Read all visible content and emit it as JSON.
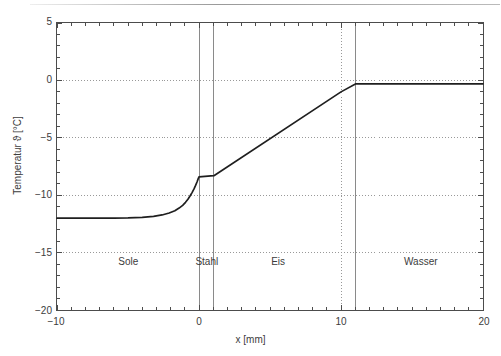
{
  "figure": {
    "background_color": "#ffffff",
    "axis_color": "#4c4c4c",
    "curve_color": "#1f1f1f",
    "grid_color": "#999999",
    "divider_color": "#8a8a8a"
  },
  "chart_data": {
    "type": "line",
    "title": "",
    "subtitle": "",
    "xlabel": "x [mm]",
    "ylabel": "Temperatur ϑ [°C]",
    "xlim": [
      -10,
      20
    ],
    "ylim": [
      -20,
      5
    ],
    "xticks": [
      -10,
      0,
      10,
      20
    ],
    "xticklabels": [
      "−10",
      "0",
      "10",
      "20"
    ],
    "yticks": [
      5,
      0,
      -5,
      -10,
      -15,
      -20
    ],
    "yticklabels": [
      "5",
      "0",
      "−5",
      "−10",
      "−15",
      "−20"
    ],
    "y_minor_tick_step": 1,
    "x_minor_tick_step": 1,
    "grid": "horizontal dotted at y = 0, -5, -10, -15; vertical dotted at x = 0 and x = 10",
    "gridlines_y": [
      0,
      -5,
      -10,
      -15
    ],
    "gridlines_x": [
      0,
      10
    ],
    "legend": "none",
    "series": [
      {
        "name": "Temperaturverlauf",
        "color": "#1f1f1f",
        "points": [
          [
            -10.0,
            -12.0
          ],
          [
            -8.0,
            -12.0
          ],
          [
            -6.0,
            -12.0
          ],
          [
            -5.0,
            -11.98
          ],
          [
            -4.0,
            -11.93
          ],
          [
            -3.2,
            -11.85
          ],
          [
            -2.6,
            -11.72
          ],
          [
            -2.1,
            -11.55
          ],
          [
            -1.7,
            -11.35
          ],
          [
            -1.4,
            -11.12
          ],
          [
            -1.15,
            -10.88
          ],
          [
            -0.95,
            -10.62
          ],
          [
            -0.78,
            -10.35
          ],
          [
            -0.62,
            -10.05
          ],
          [
            -0.48,
            -9.75
          ],
          [
            -0.35,
            -9.45
          ],
          [
            -0.24,
            -9.15
          ],
          [
            -0.14,
            -8.85
          ],
          [
            -0.06,
            -8.58
          ],
          [
            0.0,
            -8.4
          ],
          [
            1.05,
            -8.3
          ],
          [
            10.0,
            -1.0
          ],
          [
            11.05,
            -0.3
          ],
          [
            14.0,
            -0.3
          ],
          [
            17.0,
            -0.3
          ],
          [
            20.0,
            -0.3
          ]
        ]
      }
    ],
    "annotations": [
      {
        "text": "Sole",
        "x": -5.0,
        "y": -15.6,
        "type": "region-label"
      },
      {
        "text": "Stahl",
        "x": 0.5,
        "y": -15.6,
        "type": "region-label"
      },
      {
        "text": "Eis",
        "x": 5.5,
        "y": -15.6,
        "type": "region-label"
      },
      {
        "text": "Wasser",
        "x": 15.5,
        "y": -15.6,
        "type": "region-label"
      }
    ],
    "region_boundaries": [
      {
        "x": 0.0,
        "label": "Sole/Stahl"
      },
      {
        "x": 1.05,
        "label": "Stahl/Eis"
      },
      {
        "x": 10.0,
        "label": "Eis gridline"
      },
      {
        "x": 11.05,
        "label": "Eis/Wasser"
      }
    ]
  }
}
